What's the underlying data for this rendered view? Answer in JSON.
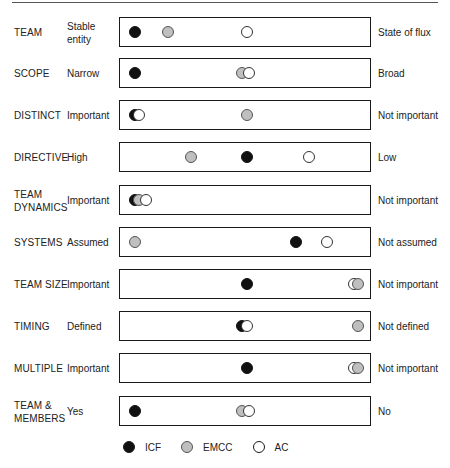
{
  "scale": {
    "min": 0,
    "max": 100,
    "px_left": 15,
    "px_span": 223
  },
  "colors": {
    "icf": "#111111",
    "emcc": "#bfbfbf",
    "ac": "#ffffff",
    "box_border": "#1a1a1a"
  },
  "legend": [
    {
      "key": "icf",
      "label": "ICF",
      "icon": "filled-black-circle"
    },
    {
      "key": "emcc",
      "label": "EMCC",
      "icon": "filled-grey-circle"
    },
    {
      "key": "ac",
      "label": "AC",
      "icon": "hollow-circle"
    }
  ],
  "rows": [
    {
      "dimension": "TEAM",
      "left": "Stable entity",
      "right": "State of flux",
      "top": 17,
      "points": [
        {
          "org": "icf",
          "pos": 0
        },
        {
          "org": "emcc",
          "pos": 15
        },
        {
          "org": "ac",
          "pos": 50
        }
      ]
    },
    {
      "dimension": "SCOPE",
      "left": "Narrow",
      "right": "Broad",
      "top": 58,
      "points": [
        {
          "org": "icf",
          "pos": 0
        },
        {
          "org": "emcc",
          "pos": 48
        },
        {
          "org": "ac",
          "pos": 51
        }
      ]
    },
    {
      "dimension": "DISTINCT",
      "left": "Important",
      "right": "Not important",
      "top": 100,
      "points": [
        {
          "org": "icf",
          "pos": 0
        },
        {
          "org": "ac",
          "pos": 2
        },
        {
          "org": "emcc",
          "pos": 50
        }
      ]
    },
    {
      "dimension": "DIRECTIVE",
      "left": "High",
      "right": "Low",
      "top": 142,
      "points": [
        {
          "org": "emcc",
          "pos": 25
        },
        {
          "org": "icf",
          "pos": 50
        },
        {
          "org": "ac",
          "pos": 78
        }
      ]
    },
    {
      "dimension": "TEAM DYNAMICS",
      "left": "Important",
      "right": "Not important",
      "top": 185,
      "points": [
        {
          "org": "icf",
          "pos": 0
        },
        {
          "org": "emcc",
          "pos": 2
        },
        {
          "org": "ac",
          "pos": 5
        }
      ]
    },
    {
      "dimension": "SYSTEMS",
      "left": "Assumed",
      "right": "Not assumed",
      "top": 227,
      "points": [
        {
          "org": "emcc",
          "pos": 0
        },
        {
          "org": "icf",
          "pos": 72
        },
        {
          "org": "ac",
          "pos": 86
        }
      ]
    },
    {
      "dimension": "TEAM SIZE",
      "left": "Important",
      "right": "Not important",
      "top": 269,
      "points": [
        {
          "org": "icf",
          "pos": 50
        },
        {
          "org": "emcc",
          "pos": 100
        },
        {
          "org": "ac",
          "pos": 98
        }
      ]
    },
    {
      "dimension": "TIMING",
      "left": "Defined",
      "right": "Not defined",
      "top": 311,
      "points": [
        {
          "org": "icf",
          "pos": 48
        },
        {
          "org": "ac",
          "pos": 50
        },
        {
          "org": "emcc",
          "pos": 100
        }
      ]
    },
    {
      "dimension": "MULTIPLE",
      "left": "Important",
      "right": "Not important",
      "top": 353,
      "points": [
        {
          "org": "icf",
          "pos": 50
        },
        {
          "org": "emcc",
          "pos": 100
        },
        {
          "org": "ac",
          "pos": 98
        }
      ]
    },
    {
      "dimension": "TEAM & MEMBERS",
      "left": "Yes",
      "right": "No",
      "top": 396,
      "points": [
        {
          "org": "icf",
          "pos": 0
        },
        {
          "org": "emcc",
          "pos": 48
        },
        {
          "org": "ac",
          "pos": 51
        }
      ]
    }
  ]
}
